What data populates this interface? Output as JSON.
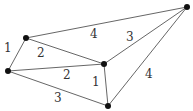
{
  "graph": {
    "nodes": [
      {
        "id": "A",
        "x": 26,
        "y": 38
      },
      {
        "id": "B",
        "x": 8,
        "y": 71
      },
      {
        "id": "C",
        "x": 104,
        "y": 64
      },
      {
        "id": "D",
        "x": 108,
        "y": 106
      },
      {
        "id": "E",
        "x": 187,
        "y": 7
      }
    ],
    "edges": [
      {
        "from": "A",
        "to": "B",
        "weight": "1",
        "lx": 4,
        "ly": 52
      },
      {
        "from": "A",
        "to": "E",
        "weight": "4",
        "lx": 90,
        "ly": 38
      },
      {
        "from": "A",
        "to": "C",
        "weight": "2",
        "lx": 37,
        "ly": 57
      },
      {
        "from": "B",
        "to": "C",
        "weight": "2",
        "lx": 63,
        "ly": 79
      },
      {
        "from": "B",
        "to": "D",
        "weight": "3",
        "lx": 54,
        "ly": 102
      },
      {
        "from": "C",
        "to": "D",
        "weight": "1",
        "lx": 92,
        "ly": 86
      },
      {
        "from": "C",
        "to": "E",
        "weight": "3",
        "lx": 126,
        "ly": 41
      },
      {
        "from": "D",
        "to": "E",
        "weight": "4",
        "lx": 145,
        "ly": 78
      }
    ]
  }
}
